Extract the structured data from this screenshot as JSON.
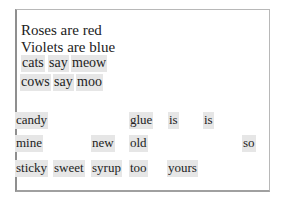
{
  "poem": {
    "line1": "Roses are red",
    "line2": "Violets are blue"
  },
  "answer_rows": [
    [
      "cats",
      "say",
      "meow"
    ],
    [
      "cows",
      "say",
      "moo"
    ]
  ],
  "word_bank": {
    "row1": [
      "candy",
      "glue",
      "is",
      "is"
    ],
    "row2": [
      "mine",
      "new",
      "old",
      "so"
    ],
    "row3": [
      "sticky",
      "sweet",
      "syrup",
      "too",
      "yours"
    ]
  },
  "colors": {
    "tile_background": "#e6e6e6",
    "border": "#b8b8b8",
    "text": "#222222"
  }
}
